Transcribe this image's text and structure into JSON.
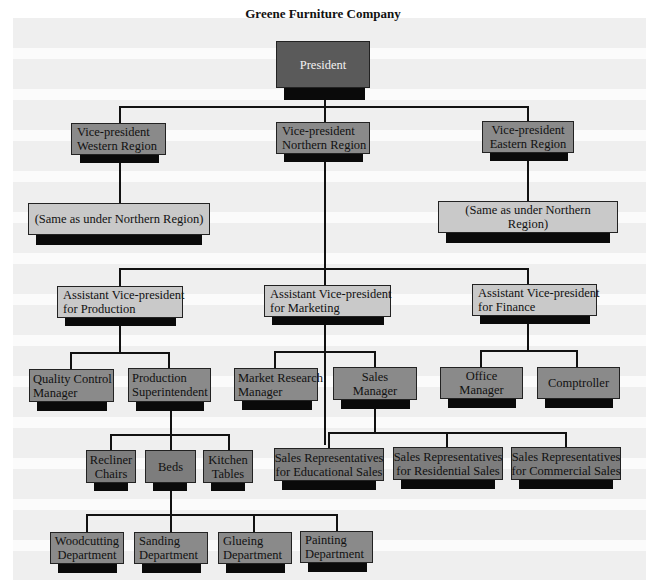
{
  "title": "Greene Furniture Company",
  "colors": {
    "president": "#5a5a5a",
    "vp": "#8a8a8a",
    "light": "#c9c9c9",
    "dark": "#7d7d7d",
    "shadow": "#0a0a0a",
    "line": "#111111"
  },
  "nodes": {
    "president": {
      "label": "President"
    },
    "vp_western": {
      "label": "Vice-president\nWestern Region"
    },
    "vp_northern": {
      "label": "Vice-president\nNorthern Region"
    },
    "vp_eastern": {
      "label": "Vice-president\nEastern Region"
    },
    "same_west": {
      "label": "(Same as under Northern Region)"
    },
    "same_east": {
      "label": "(Same as under Northern Region)"
    },
    "avp_production": {
      "label": "Assistant Vice-president\nfor Production"
    },
    "avp_marketing": {
      "label": "Assistant Vice-president\nfor Marketing"
    },
    "avp_finance": {
      "label": "Assistant Vice-president\nfor Finance"
    },
    "quality_control": {
      "label": "Quality Control\nManager"
    },
    "production_super": {
      "label": "Production\nSuperintendent"
    },
    "market_research": {
      "label": "Market Research\nManager"
    },
    "sales_manager": {
      "label": "Sales Manager"
    },
    "office_manager": {
      "label": "Office Manager"
    },
    "comptroller": {
      "label": "Comptroller"
    },
    "recliner": {
      "label": "Recliner\nChairs"
    },
    "beds": {
      "label": "Beds"
    },
    "kitchen": {
      "label": "Kitchen\nTables"
    },
    "sr_edu": {
      "label": "Sales Representatives\nfor Educational Sales"
    },
    "sr_res": {
      "label": "Sales Representatives\nfor Residential Sales"
    },
    "sr_com": {
      "label": "Sales Representatives\nfor Commercial Sales"
    },
    "woodcutting": {
      "label": "Woodcutting\nDepartment"
    },
    "sanding": {
      "label": "Sanding\nDepartment"
    },
    "glueing": {
      "label": "Glueing\nDepartment"
    },
    "painting": {
      "label": "Painting\nDepartment"
    }
  }
}
